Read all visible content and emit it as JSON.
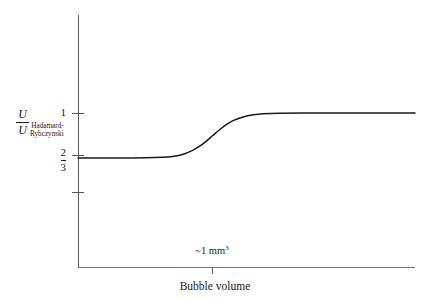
{
  "figure": {
    "background_color": "#ffffff",
    "axis_color": "#555555",
    "curve_color": "#1a1a1a"
  },
  "y_axis": {
    "title": {
      "numerator": "U",
      "denominator": "U",
      "subscript_line1": "Hadamard-",
      "subscript_line2": "Rybczynski"
    },
    "ticks": [
      {
        "label": "1",
        "type": "plain"
      },
      {
        "label": "2/3",
        "type": "fraction",
        "numerator": "2",
        "denominator": "3"
      },
      {
        "label": "",
        "type": "unlabeled"
      }
    ]
  },
  "x_axis": {
    "title": "Bubble volume",
    "ticks": [
      {
        "label_prefix": "~1 mm",
        "label_exponent": "3"
      }
    ]
  },
  "chart_data": {
    "type": "line",
    "title": "",
    "subtitle": "",
    "xlabel": "Bubble volume",
    "ylabel": "U / U_Hadamard-Rybczynski",
    "grid": false,
    "legend": null,
    "xlim": [
      0,
      1
    ],
    "ylim": [
      0.333,
      1.22
    ],
    "ytick_values": [
      1,
      0.6667,
      0.4
    ],
    "ytick_labels": [
      "1",
      "2/3",
      ""
    ],
    "xtick_values": [
      0.4
    ],
    "xtick_labels": [
      "~1 mm³"
    ],
    "annotations": [
      {
        "text": "~1 mm³",
        "x": 0.4,
        "y": 0,
        "note": "transition volume on x-axis"
      }
    ],
    "series": [
      {
        "name": "U/U_HR vs bubble volume",
        "description": "Sigmoidal transition from 2/3 (mobile/clean interface, Hadamard-Rybczynski) to 1 (rigid/contaminated interface, Stokes) near 1 mm^3 bubble volume",
        "color": "#1a1a1a",
        "x": [
          0.0,
          0.05,
          0.1,
          0.15,
          0.2,
          0.25,
          0.28,
          0.31,
          0.34,
          0.36,
          0.38,
          0.4,
          0.42,
          0.44,
          0.46,
          0.49,
          0.52,
          0.55,
          0.6,
          0.7,
          0.8,
          0.9,
          1.0
        ],
        "y": [
          0.667,
          0.667,
          0.667,
          0.667,
          0.668,
          0.672,
          0.678,
          0.692,
          0.723,
          0.752,
          0.79,
          0.833,
          0.876,
          0.914,
          0.944,
          0.971,
          0.987,
          0.995,
          0.999,
          1.0,
          1.0,
          1.0,
          1.0
        ]
      }
    ]
  }
}
